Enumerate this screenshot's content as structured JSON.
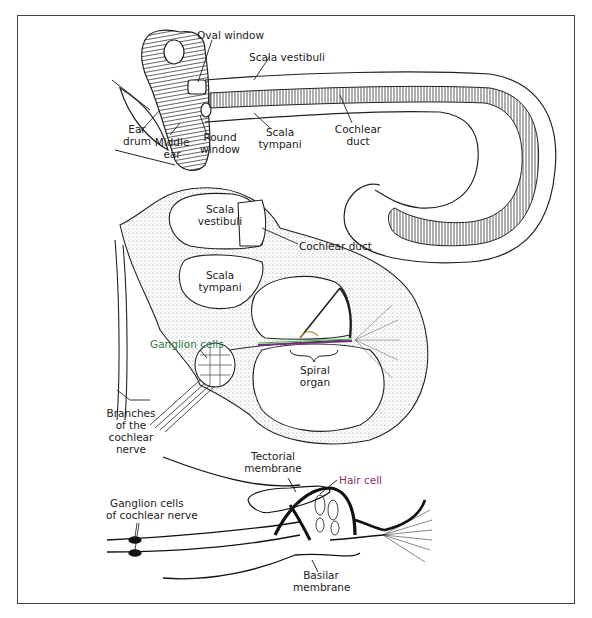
{
  "figure": {
    "colors": {
      "line": "#222222",
      "stipple": "#9a9a9a",
      "ganglion_label": "#2e7d4a",
      "hair_cell_label": "#8a2e6e",
      "border": "#444444"
    }
  },
  "panel_top": {
    "labels": {
      "oval_window": "Oval window",
      "scala_vestibuli": "Scala vestibuli",
      "ear_drum_1": "Ear",
      "ear_drum_2": "drum",
      "middle_ear_1": "Middle",
      "middle_ear_2": "ear",
      "round_window_1": "Round",
      "round_window_2": "window",
      "scala_tympani_1": "Scala",
      "scala_tympani_2": "tympani",
      "cochlear_duct_1": "Cochlear",
      "cochlear_duct_2": "duct"
    }
  },
  "panel_middle": {
    "labels": {
      "scala_vestibuli_1": "Scala",
      "scala_vestibuli_2": "vestibuli",
      "cochlear_duct": "Cochlear duct",
      "scala_tympani_1": "Scala",
      "scala_tympani_2": "tympani",
      "ganglion_cells": "Ganglion cells",
      "spiral_organ_1": "Spiral",
      "spiral_organ_2": "organ",
      "branches_1": "Branches",
      "branches_2": "of the",
      "branches_3": "cochlear",
      "branches_4": "nerve"
    }
  },
  "panel_bottom": {
    "labels": {
      "tectorial_1": "Tectorial",
      "tectorial_2": "membrane",
      "hair_cell": "Hair cell",
      "ganglion_cochlear_1": "Ganglion cells",
      "ganglion_cochlear_2": "of cochlear nerve",
      "basilar_1": "Basilar",
      "basilar_2": "membrane"
    }
  }
}
